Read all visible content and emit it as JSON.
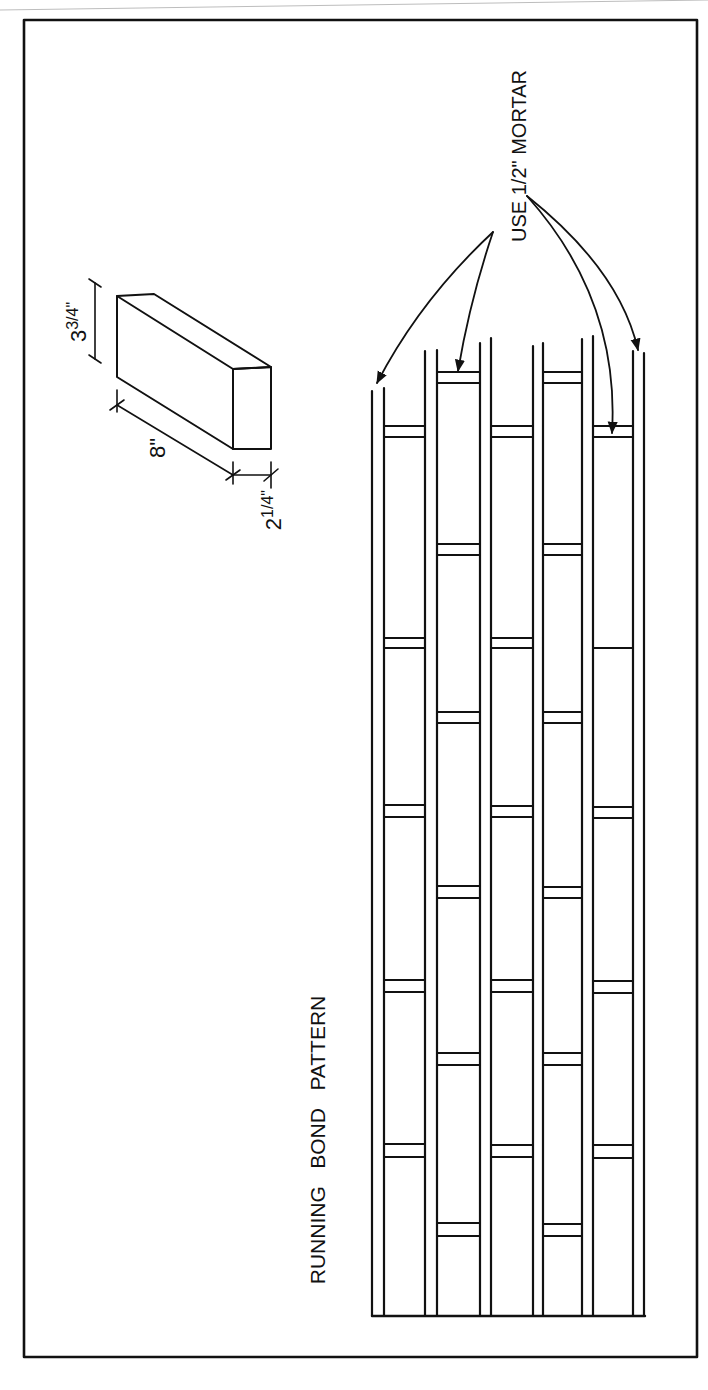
{
  "colors": {
    "paper": "#ffffff",
    "ink": "#111111",
    "scan_edge": "#bdbdbd"
  },
  "frame": {
    "x1": 24,
    "y1": 20,
    "x2": 697,
    "y2": 1357
  },
  "title": {
    "text": "RUNNING   BOND   PATTERN",
    "x": 325,
    "y": 1140
  },
  "mortar_note": {
    "text": "USE 1/2\" MORTAR",
    "x": 519,
    "y": 156,
    "arrows_left_origin": [
      493,
      232
    ],
    "arrows_right_origin": [
      527,
      196
    ],
    "arrow_targets": [
      {
        "from": "left",
        "to": [
          377,
          383
        ],
        "ctrl": [
          420,
          300
        ]
      },
      {
        "from": "left",
        "to": [
          458,
          371
        ],
        "ctrl": [
          470,
          300
        ]
      },
      {
        "from": "right",
        "to": [
          612,
          433
        ],
        "ctrl": [
          620,
          300
        ]
      },
      {
        "from": "right",
        "to": [
          638,
          350
        ],
        "ctrl": [
          620,
          270
        ]
      }
    ]
  },
  "brick_detail": {
    "label_length": "8\"",
    "label_height": "3 3/4\"",
    "label_width": "2 1/4\"",
    "label_height_main": "3",
    "label_height_frac": "3/4\"",
    "label_width_main": "2",
    "label_width_frac": "1/4\""
  },
  "wall": {
    "bottom": 1316,
    "left": 372,
    "right": 645,
    "lines": [
      {
        "x": 372,
        "top": 391
      },
      {
        "x": 384,
        "top": 388
      },
      {
        "x": 425,
        "top": 351
      },
      {
        "x": 437,
        "top": 350
      },
      {
        "x": 480,
        "top": 343
      },
      {
        "x": 491,
        "top": 338
      },
      {
        "x": 533,
        "top": 346
      },
      {
        "x": 543,
        "top": 343
      },
      {
        "x": 582,
        "top": 339
      },
      {
        "x": 593,
        "top": 336
      },
      {
        "x": 633,
        "top": 351
      },
      {
        "x": 644,
        "top": 353
      }
    ],
    "courses": [
      {
        "name": "course-1",
        "x1": 384,
        "x2": 425,
        "joints": [
          [
            426,
            437
          ],
          [
            638,
            648
          ],
          [
            805,
            817
          ],
          [
            980,
            992
          ],
          [
            1144,
            1157
          ]
        ]
      },
      {
        "name": "course-2",
        "x1": 437,
        "x2": 480,
        "joints": [
          [
            372,
            383
          ],
          [
            544,
            555
          ],
          [
            712,
            723
          ],
          [
            886,
            898
          ],
          [
            1053,
            1065
          ],
          [
            1223,
            1236
          ]
        ]
      },
      {
        "name": "course-3",
        "x1": 491,
        "x2": 533,
        "joints": [
          [
            426,
            437
          ],
          [
            638,
            648
          ],
          [
            806,
            817
          ],
          [
            980,
            992
          ],
          [
            1145,
            1157
          ]
        ]
      },
      {
        "name": "course-4",
        "x1": 543,
        "x2": 582,
        "joints": [
          [
            372,
            383
          ],
          [
            544,
            555
          ],
          [
            712,
            723
          ],
          [
            887,
            898
          ],
          [
            1053,
            1065
          ],
          [
            1224,
            1236
          ]
        ]
      },
      {
        "name": "course-5",
        "x1": 593,
        "x2": 633,
        "joints": [
          [
            426,
            437
          ],
          [
            648,
            648
          ],
          [
            807,
            818
          ],
          [
            981,
            993
          ],
          [
            1145,
            1158
          ]
        ]
      }
    ]
  }
}
